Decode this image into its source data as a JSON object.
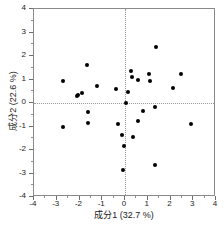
{
  "chart_data": {
    "type": "scatter",
    "title": "",
    "xlabel": "成分1  (32.7 %)",
    "ylabel": "成分2  (22.6 %)",
    "xlim": [
      -4,
      4
    ],
    "ylim": [
      -4,
      4
    ],
    "xticks": [
      -4,
      -3,
      -2,
      -1,
      0,
      1,
      2,
      3,
      4
    ],
    "xtick_labels": [
      "-4",
      "-3",
      "-2",
      "-1",
      "0",
      "1",
      "2",
      "3",
      "4"
    ],
    "yticks": [
      -4,
      -3,
      -2,
      -1,
      0,
      1,
      2,
      3,
      4
    ],
    "ytick_labels": [
      "-4",
      "-3",
      "-2",
      "-1",
      "0",
      "1",
      "2",
      "3",
      "4"
    ],
    "grid": false,
    "reference_lines": {
      "x": 0,
      "y": 0,
      "style": "dotted"
    },
    "legend": null,
    "marker": {
      "shape": "circle",
      "color": "#000000",
      "size": 4
    },
    "points": [
      {
        "x": -2.72,
        "y": 0.95
      },
      {
        "x": -2.72,
        "y": -1.02
      },
      {
        "x": -2.12,
        "y": 0.28
      },
      {
        "x": -2.05,
        "y": 0.34
      },
      {
        "x": -1.9,
        "y": 0.42
      },
      {
        "x": -1.65,
        "y": 1.6
      },
      {
        "x": -1.62,
        "y": -0.37
      },
      {
        "x": -1.62,
        "y": -0.83
      },
      {
        "x": -1.22,
        "y": 0.72
      },
      {
        "x": -0.38,
        "y": 0.6
      },
      {
        "x": -0.3,
        "y": -0.9
      },
      {
        "x": -0.12,
        "y": -1.38
      },
      {
        "x": -0.1,
        "y": -2.86
      },
      {
        "x": -0.05,
        "y": -1.85
      },
      {
        "x": 0.05,
        "y": -0.02
      },
      {
        "x": 0.12,
        "y": 0.47
      },
      {
        "x": 0.28,
        "y": 1.38
      },
      {
        "x": 0.3,
        "y": 1.1
      },
      {
        "x": 0.33,
        "y": -1.43
      },
      {
        "x": 0.55,
        "y": 0.98
      },
      {
        "x": 0.58,
        "y": -0.75
      },
      {
        "x": 0.8,
        "y": -0.33
      },
      {
        "x": 1.05,
        "y": 1.22
      },
      {
        "x": 1.12,
        "y": 0.92
      },
      {
        "x": 1.3,
        "y": -0.15
      },
      {
        "x": 1.33,
        "y": -2.63
      },
      {
        "x": 1.35,
        "y": 2.4
      },
      {
        "x": 2.12,
        "y": 0.62
      },
      {
        "x": 2.45,
        "y": 1.25
      },
      {
        "x": 2.92,
        "y": -0.9
      }
    ]
  }
}
